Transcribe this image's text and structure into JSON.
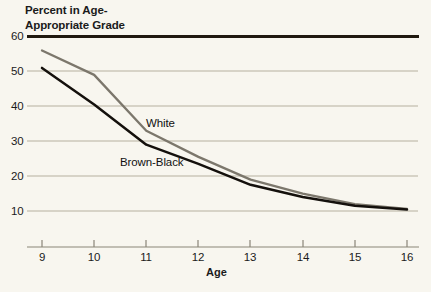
{
  "title": "Percent in Age-\nAppropriate Grade",
  "axis": {
    "x_title": "Age"
  },
  "colors": {
    "background": "#f8f6ef",
    "gridline": "#b5b0a0",
    "top_rule": "#20190f",
    "white_series": "#7c776c",
    "brown_black_series": "#14100c",
    "text": "#1b1b1b"
  },
  "chart_data": {
    "type": "line",
    "xlabel": "Age",
    "ylabel": "Percent in Age-Appropriate Grade",
    "x": [
      9,
      10,
      11,
      12,
      13,
      14,
      15,
      16
    ],
    "xlim": [
      9,
      16
    ],
    "ylim": [
      5,
      62
    ],
    "yticks": [
      60,
      50,
      40,
      30,
      20,
      10
    ],
    "xticks": [
      9,
      10,
      11,
      12,
      13,
      14,
      15,
      16
    ],
    "grid": "horizontal",
    "legend": "inline-annotations",
    "series": [
      {
        "name": "White",
        "color": "#7c776c",
        "values": [
          56.0,
          49.0,
          33.0,
          25.5,
          19.0,
          15.0,
          12.0,
          10.6
        ]
      },
      {
        "name": "Brown-Black",
        "color": "#14100c",
        "values": [
          51.0,
          40.5,
          29.0,
          23.5,
          17.5,
          14.0,
          11.5,
          10.4
        ]
      }
    ],
    "annotations": [
      {
        "text": "White",
        "x": 11.05,
        "y": 36.5
      },
      {
        "text": "Brown-Black",
        "x": 10.55,
        "y": 25.2
      }
    ]
  },
  "ytick_labels": [
    "60",
    "50",
    "40",
    "30",
    "20",
    "10"
  ],
  "xtick_labels": [
    "9",
    "10",
    "11",
    "12",
    "13",
    "14",
    "15",
    "16"
  ],
  "series_names": {
    "white": "White",
    "brown_black": "Brown-Black"
  }
}
